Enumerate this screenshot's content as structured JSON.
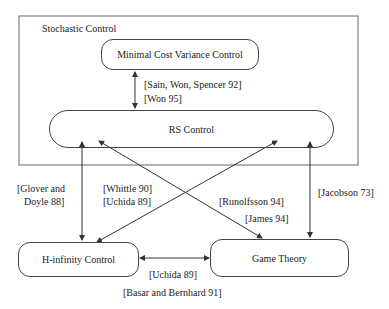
{
  "container": {
    "label": "Stochastic Control"
  },
  "nodes": {
    "mcv": {
      "label": "Minimal Cost Variance Control"
    },
    "rs": {
      "label": "RS Control"
    },
    "hinf": {
      "label": "H-infinity Control"
    },
    "game": {
      "label": "Game Theory"
    }
  },
  "edges": {
    "mcv_rs": {
      "refs": [
        "[Sain, Won, Spencer 92]",
        "[Won 95]"
      ]
    },
    "rs_hinf": {
      "refs": [
        "[Glover and",
        "Doyle 88]"
      ]
    },
    "rs_hinf_cross": {
      "refs": [
        "[Whittle 90]",
        "[Uchida 89]"
      ]
    },
    "rs_game_cross": {
      "refs": [
        "[Runolfsson 94]",
        "[James 94]"
      ]
    },
    "rs_game": {
      "refs": [
        "[Jacobson 73]"
      ]
    },
    "hinf_game": {
      "refs": [
        "[Uchida 89]",
        "[Basar and Bernhard 91]"
      ]
    }
  },
  "colors": {
    "line": "#333333",
    "text": "#222222",
    "background": "#ffffff"
  }
}
